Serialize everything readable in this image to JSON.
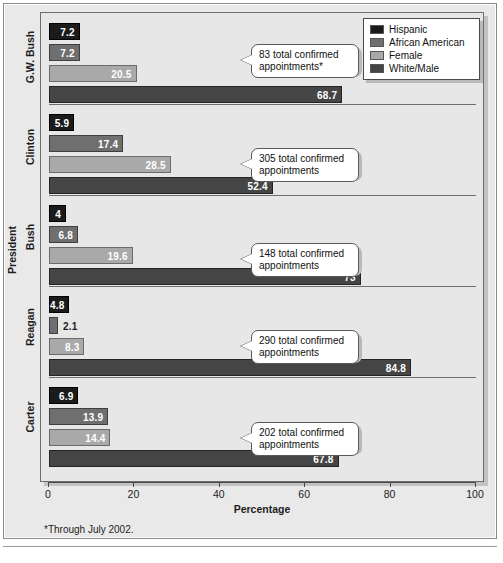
{
  "chart_data": {
    "type": "bar",
    "orientation": "horizontal",
    "title": "",
    "xlabel": "Percentage",
    "ylabel": "President",
    "xlim": [
      0,
      100
    ],
    "xticks": [
      0,
      20,
      40,
      60,
      80,
      100
    ],
    "grid": false,
    "legend_position": "top-right",
    "legend": [
      "Hispanic",
      "African American",
      "Female",
      "White/Male"
    ],
    "series": [
      {
        "name": "Hispanic",
        "color": "#1b1b1b",
        "values": [
          7.2,
          5.9,
          4,
          4.8,
          6.9
        ]
      },
      {
        "name": "African American",
        "color": "#6f6f6f",
        "values": [
          7.2,
          17.4,
          6.8,
          2.1,
          13.9
        ]
      },
      {
        "name": "Female",
        "color": "#a9a9a9",
        "values": [
          20.5,
          28.5,
          19.6,
          8.3,
          14.4
        ]
      },
      {
        "name": "White/Male",
        "color": "#454545",
        "values": [
          68.7,
          52.4,
          73,
          84.8,
          67.8
        ]
      }
    ],
    "categories": [
      "G.W. Bush",
      "Clinton",
      "Bush",
      "Reagan",
      "Carter"
    ],
    "annotations": [
      "83 total confirmed appointments*",
      "305 total confirmed appointments",
      "148 total confirmed appointments",
      "290 total confirmed appointments",
      "202 total confirmed appointments"
    ],
    "footnote": "*Through July 2002."
  },
  "groups": [
    {
      "category": "G.W. Bush",
      "callout": "83 total confirmed\nappointments*",
      "bars": [
        {
          "series": "Hispanic",
          "value": 7.2,
          "label": "7.2",
          "label_inside": true
        },
        {
          "series": "African American",
          "value": 7.2,
          "label": "7.2",
          "label_inside": true
        },
        {
          "series": "Female",
          "value": 20.5,
          "label": "20.5",
          "label_inside": true
        },
        {
          "series": "White/Male",
          "value": 68.7,
          "label": "68.7",
          "label_inside": true
        }
      ]
    },
    {
      "category": "Clinton",
      "callout": "305 total confirmed\nappointments",
      "bars": [
        {
          "series": "Hispanic",
          "value": 5.9,
          "label": "5.9",
          "label_inside": true
        },
        {
          "series": "African American",
          "value": 17.4,
          "label": "17.4",
          "label_inside": true
        },
        {
          "series": "Female",
          "value": 28.5,
          "label": "28.5",
          "label_inside": true
        },
        {
          "series": "White/Male",
          "value": 52.4,
          "label": "52.4",
          "label_inside": true
        }
      ]
    },
    {
      "category": "Bush",
      "callout": "148 total confirmed\nappointments",
      "bars": [
        {
          "series": "Hispanic",
          "value": 4,
          "label": "4",
          "label_inside": true
        },
        {
          "series": "African American",
          "value": 6.8,
          "label": "6.8",
          "label_inside": true
        },
        {
          "series": "Female",
          "value": 19.6,
          "label": "19.6",
          "label_inside": true
        },
        {
          "series": "White/Male",
          "value": 73,
          "label": "73",
          "label_inside": true
        }
      ]
    },
    {
      "category": "Reagan",
      "callout": "290 total confirmed\nappointments",
      "bars": [
        {
          "series": "Hispanic",
          "value": 4.8,
          "label": "4.8",
          "label_inside": true
        },
        {
          "series": "African American",
          "value": 2.1,
          "label": "2.1",
          "label_inside": false
        },
        {
          "series": "Female",
          "value": 8.3,
          "label": "8.3",
          "label_inside": true
        },
        {
          "series": "White/Male",
          "value": 84.8,
          "label": "84.8",
          "label_inside": true
        }
      ]
    },
    {
      "category": "Carter",
      "callout": "202 total confirmed\nappointments",
      "bars": [
        {
          "series": "Hispanic",
          "value": 6.9,
          "label": "6.9",
          "label_inside": true
        },
        {
          "series": "African American",
          "value": 13.9,
          "label": "13.9",
          "label_inside": true
        },
        {
          "series": "Female",
          "value": 14.4,
          "label": "14.4",
          "label_inside": true
        },
        {
          "series": "White/Male",
          "value": 67.8,
          "label": "67.8",
          "label_inside": true
        }
      ]
    }
  ],
  "axis": {
    "x_title": "Percentage",
    "y_title": "President",
    "x_ticks": [
      "0",
      "20",
      "40",
      "60",
      "80",
      "100"
    ]
  },
  "legend": {
    "items": [
      {
        "label": "Hispanic",
        "color": "#1b1b1b"
      },
      {
        "label": "African American",
        "color": "#6f6f6f"
      },
      {
        "label": "Female",
        "color": "#a9a9a9"
      },
      {
        "label": "White/Male",
        "color": "#454545"
      }
    ]
  },
  "footnote": "*Through July 2002."
}
